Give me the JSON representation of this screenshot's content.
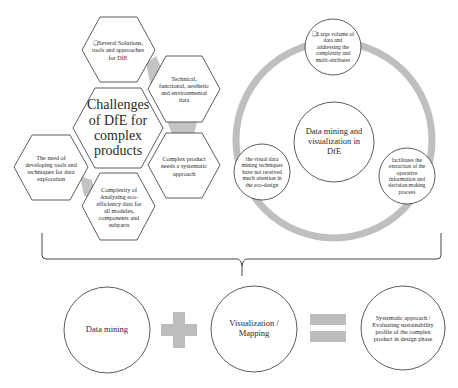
{
  "challenges": {
    "center": "Challenges of DfE for complex products",
    "items": [
      "❑Several Solutions, tools and approaches for DfE",
      "Technical, functional, aesthetic and environmental data",
      "Complex product needs a systematic approach",
      "Complexity of Analyzing eco-efficiency data for all modules, components and subparts",
      "The need of developing tools and techniques for data exploration"
    ]
  },
  "cycle": {
    "center": "Data mining and visualization in DfE",
    "items": [
      "❑Large volume of data and addressing the complexity and multi-attributes",
      "facilitates the extraction of the operative information and decision-making process",
      "the visual data mining techniques have not received much attention in the eco-design"
    ]
  },
  "equation": {
    "term1": "Data mining",
    "operator1": "plus",
    "term2": "Visualization / Mapping",
    "operator2": "equals",
    "result": "Systematic approach / Evaluating sustainability profile of the complex product in design phase"
  },
  "colors": {
    "connector_gray": "#bdbdbd",
    "outline": "#333333"
  }
}
